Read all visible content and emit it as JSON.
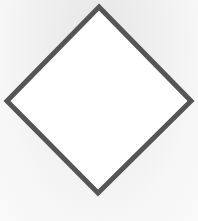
{
  "diagram": {
    "shape": "diamond",
    "vertices": {
      "top": [
        99,
        7
      ],
      "right": [
        191,
        101
      ],
      "bottom": [
        98,
        193
      ],
      "left": [
        7,
        101
      ]
    },
    "stroke_color": "#555555",
    "stroke_width": 5,
    "fill_color": "#ffffff",
    "background_color": "#eeeeee"
  }
}
